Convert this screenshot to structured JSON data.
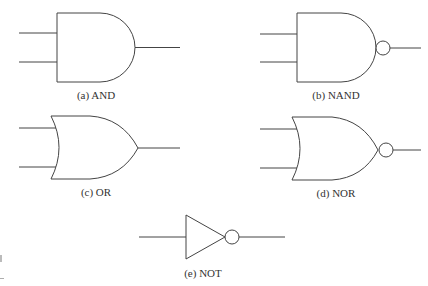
{
  "figure": {
    "gates": [
      {
        "id": "a",
        "type": "AND",
        "label": "(a)  AND"
      },
      {
        "id": "b",
        "type": "NAND",
        "label": "(b)  NAND"
      },
      {
        "id": "c",
        "type": "OR",
        "label": "(c)  OR"
      },
      {
        "id": "d",
        "type": "NOR",
        "label": "(d)  NOR"
      },
      {
        "id": "e",
        "type": "NOT",
        "label": "(e)  NOT"
      }
    ],
    "colors": {
      "stroke": "#444444",
      "background": "#ffffff"
    }
  }
}
